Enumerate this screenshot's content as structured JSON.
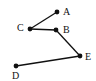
{
  "diagram": {
    "type": "graph",
    "nodes": [
      {
        "id": "A",
        "label": "A"
      },
      {
        "id": "B",
        "label": "B"
      },
      {
        "id": "C",
        "label": "C"
      },
      {
        "id": "D",
        "label": "D"
      },
      {
        "id": "E",
        "label": "E"
      }
    ],
    "edges": [
      {
        "from": "C",
        "to": "A"
      },
      {
        "from": "C",
        "to": "B"
      },
      {
        "from": "B",
        "to": "E"
      },
      {
        "from": "E",
        "to": "D"
      }
    ],
    "colors": {
      "ink": "#111111",
      "background": "#ffffff"
    }
  }
}
